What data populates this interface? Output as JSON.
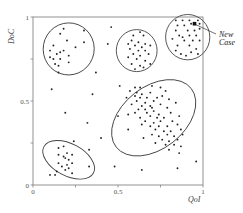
{
  "chart_data": {
    "type": "scatter",
    "title": "",
    "xlabel": "QoI",
    "ylabel": "DoC",
    "xlim": [
      0,
      1
    ],
    "ylim": [
      0,
      1
    ],
    "x_ticks": [
      {
        "value": 0,
        "label": "0"
      },
      {
        "value": 0.25,
        "label": ""
      },
      {
        "value": 0.5,
        "label": "0.5"
      },
      {
        "value": 0.75,
        "label": ""
      },
      {
        "value": 1,
        "label": "1"
      }
    ],
    "y_ticks": [
      {
        "value": 0,
        "label": "0"
      },
      {
        "value": 0.25,
        "label": ""
      },
      {
        "value": 0.5,
        "label": "0.5"
      },
      {
        "value": 0.75,
        "label": ""
      },
      {
        "value": 1,
        "label": "1"
      }
    ],
    "grid": false,
    "legend": null,
    "annotation": {
      "lines": [
        "New",
        "Case"
      ],
      "target": [
        0.95,
        0.96
      ]
    },
    "new_case": {
      "x": 0.95,
      "y": 0.96
    },
    "clusters": [
      {
        "name": "top-left",
        "cx": 0.21,
        "cy": 0.81,
        "rx": 0.15,
        "ry": 0.155,
        "rotate": -10,
        "points": [
          [
            0.18,
            0.93
          ],
          [
            0.3,
            0.92
          ],
          [
            0.16,
            0.9
          ],
          [
            0.2,
            0.86
          ],
          [
            0.3,
            0.85
          ],
          [
            0.12,
            0.83
          ],
          [
            0.1,
            0.8
          ],
          [
            0.25,
            0.82
          ],
          [
            0.16,
            0.79
          ],
          [
            0.14,
            0.78
          ],
          [
            0.18,
            0.8
          ],
          [
            0.1,
            0.76
          ],
          [
            0.12,
            0.75
          ],
          [
            0.16,
            0.75
          ],
          [
            0.21,
            0.77
          ],
          [
            0.13,
            0.72
          ],
          [
            0.15,
            0.71
          ],
          [
            0.21,
            0.73
          ],
          [
            0.15,
            0.67
          ]
        ]
      },
      {
        "name": "top-middle",
        "cx": 0.61,
        "cy": 0.8,
        "rx": 0.12,
        "ry": 0.125,
        "rotate": 0,
        "points": [
          [
            0.63,
            0.91
          ],
          [
            0.59,
            0.89
          ],
          [
            0.65,
            0.89
          ],
          [
            0.58,
            0.86
          ],
          [
            0.62,
            0.85
          ],
          [
            0.56,
            0.84
          ],
          [
            0.66,
            0.84
          ],
          [
            0.6,
            0.83
          ],
          [
            0.64,
            0.82
          ],
          [
            0.69,
            0.83
          ],
          [
            0.57,
            0.81
          ],
          [
            0.62,
            0.8
          ],
          [
            0.66,
            0.8
          ],
          [
            0.59,
            0.78
          ],
          [
            0.63,
            0.77
          ],
          [
            0.68,
            0.78
          ],
          [
            0.56,
            0.76
          ],
          [
            0.61,
            0.75
          ],
          [
            0.66,
            0.74
          ],
          [
            0.58,
            0.72
          ],
          [
            0.63,
            0.71
          ],
          [
            0.69,
            0.72
          ],
          [
            0.6,
            0.69
          ],
          [
            0.65,
            0.7
          ]
        ]
      },
      {
        "name": "top-right",
        "cx": 0.91,
        "cy": 0.88,
        "rx": 0.13,
        "ry": 0.135,
        "rotate": 0,
        "points": [
          [
            0.84,
            0.98
          ],
          [
            0.88,
            0.98
          ],
          [
            0.92,
            0.98
          ],
          [
            0.97,
            0.98
          ],
          [
            0.85,
            0.95
          ],
          [
            0.89,
            0.95
          ],
          [
            0.93,
            0.96
          ],
          [
            0.98,
            0.96
          ],
          [
            0.84,
            0.92
          ],
          [
            0.91,
            0.92
          ],
          [
            0.95,
            0.92
          ],
          [
            0.98,
            0.93
          ],
          [
            0.86,
            0.89
          ],
          [
            0.88,
            0.88
          ],
          [
            0.92,
            0.89
          ],
          [
            0.96,
            0.89
          ],
          [
            0.82,
            0.87
          ],
          [
            0.89,
            0.86
          ],
          [
            0.94,
            0.86
          ],
          [
            0.98,
            0.86
          ],
          [
            0.85,
            0.83
          ],
          [
            0.92,
            0.83
          ],
          [
            0.96,
            0.81
          ],
          [
            0.84,
            0.8
          ],
          [
            0.93,
            0.79
          ],
          [
            0.97,
            0.78
          ],
          [
            0.87,
            0.78
          ],
          [
            0.9,
            0.77
          ]
        ]
      },
      {
        "name": "center-large",
        "cx": 0.71,
        "cy": 0.4,
        "rx": 0.28,
        "ry": 0.185,
        "rotate": 38,
        "points": [
          [
            0.51,
            0.59
          ],
          [
            0.6,
            0.58
          ],
          [
            0.63,
            0.58
          ],
          [
            0.7,
            0.59
          ],
          [
            0.75,
            0.58
          ],
          [
            0.57,
            0.56
          ],
          [
            0.61,
            0.55
          ],
          [
            0.64,
            0.54
          ],
          [
            0.69,
            0.55
          ],
          [
            0.78,
            0.56
          ],
          [
            0.6,
            0.53
          ],
          [
            0.63,
            0.52
          ],
          [
            0.67,
            0.52
          ],
          [
            0.73,
            0.52
          ],
          [
            0.76,
            0.53
          ],
          [
            0.55,
            0.52
          ],
          [
            0.61,
            0.5
          ],
          [
            0.66,
            0.49
          ],
          [
            0.71,
            0.5
          ],
          [
            0.8,
            0.51
          ],
          [
            0.58,
            0.48
          ],
          [
            0.64,
            0.47
          ],
          [
            0.69,
            0.47
          ],
          [
            0.75,
            0.48
          ],
          [
            0.84,
            0.49
          ],
          [
            0.62,
            0.45
          ],
          [
            0.66,
            0.45
          ],
          [
            0.7,
            0.46
          ],
          [
            0.79,
            0.46
          ],
          [
            0.6,
            0.43
          ],
          [
            0.67,
            0.43
          ],
          [
            0.71,
            0.44
          ],
          [
            0.74,
            0.42
          ],
          [
            0.81,
            0.43
          ],
          [
            0.56,
            0.42
          ],
          [
            0.63,
            0.4
          ],
          [
            0.69,
            0.41
          ],
          [
            0.73,
            0.4
          ],
          [
            0.77,
            0.4
          ],
          [
            0.86,
            0.41
          ],
          [
            0.5,
            0.41
          ],
          [
            0.66,
            0.38
          ],
          [
            0.71,
            0.37
          ],
          [
            0.75,
            0.38
          ],
          [
            0.82,
            0.38
          ],
          [
            0.64,
            0.36
          ],
          [
            0.69,
            0.35
          ],
          [
            0.74,
            0.35
          ],
          [
            0.79,
            0.35
          ],
          [
            0.85,
            0.36
          ],
          [
            0.56,
            0.33
          ],
          [
            0.72,
            0.33
          ],
          [
            0.77,
            0.32
          ],
          [
            0.81,
            0.32
          ],
          [
            0.87,
            0.33
          ],
          [
            0.7,
            0.3
          ],
          [
            0.74,
            0.29
          ],
          [
            0.79,
            0.3
          ],
          [
            0.83,
            0.29
          ],
          [
            0.88,
            0.3
          ],
          [
            0.65,
            0.28
          ],
          [
            0.76,
            0.27
          ],
          [
            0.8,
            0.26
          ],
          [
            0.85,
            0.27
          ],
          [
            0.72,
            0.25
          ],
          [
            0.78,
            0.24
          ],
          [
            0.83,
            0.24
          ],
          [
            0.87,
            0.23
          ],
          [
            0.8,
            0.21
          ],
          [
            0.86,
            0.19
          ]
        ]
      },
      {
        "name": "bottom-left",
        "cx": 0.21,
        "cy": 0.15,
        "rx": 0.165,
        "ry": 0.095,
        "rotate": -28,
        "points": [
          [
            0.24,
            0.26
          ],
          [
            0.15,
            0.22
          ],
          [
            0.18,
            0.23
          ],
          [
            0.33,
            0.21
          ],
          [
            0.2,
            0.19
          ],
          [
            0.15,
            0.18
          ],
          [
            0.18,
            0.17
          ],
          [
            0.23,
            0.18
          ],
          [
            0.19,
            0.16
          ],
          [
            0.21,
            0.15
          ],
          [
            0.15,
            0.13
          ],
          [
            0.23,
            0.13
          ],
          [
            0.2,
            0.12
          ],
          [
            0.17,
            0.11
          ],
          [
            0.21,
            0.1
          ],
          [
            0.33,
            0.11
          ],
          [
            0.19,
            0.09
          ],
          [
            0.14,
            0.08
          ],
          [
            0.23,
            0.07
          ],
          [
            0.1,
            0.06
          ],
          [
            0.13,
            0.06
          ]
        ]
      }
    ],
    "outliers": [
      [
        0.46,
        0.94
      ],
      [
        0.44,
        0.84
      ],
      [
        0.37,
        0.67
      ],
      [
        0.11,
        0.57
      ],
      [
        0.35,
        0.54
      ],
      [
        0.19,
        0.43
      ],
      [
        0.32,
        0.37
      ],
      [
        0.4,
        0.28
      ],
      [
        0.48,
        0.11
      ],
      [
        0.64,
        0.09
      ],
      [
        0.85,
        0.1
      ],
      [
        0.96,
        0.14
      ]
    ]
  }
}
